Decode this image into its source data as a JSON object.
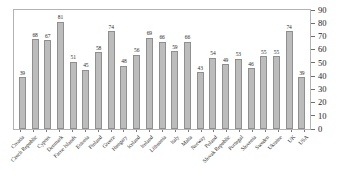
{
  "chart_data": {
    "type": "bar",
    "title": "",
    "subtitle": "",
    "xlabel": "",
    "ylabel": "",
    "ylim": [
      0,
      90
    ],
    "yticks": [
      0,
      10,
      20,
      30,
      40,
      50,
      60,
      70,
      80,
      90
    ],
    "y_axis_position": "right",
    "grid": false,
    "legend": "none",
    "bar_fill_color": "#bcbcbc",
    "bar_border_color": "#8f8f8f",
    "frame_color": "#b3b3b3",
    "categories": [
      "Croatia",
      "Czech Republic",
      "Cyprus",
      "Denmark",
      "Faroe Islands",
      "Estonia",
      "Finland",
      "Greece",
      "Hungary",
      "Iceland",
      "Ireland",
      "Lithuania",
      "Italy",
      "Malta",
      "Norway",
      "Poland",
      "Slovak Republic",
      "Portugal",
      "Slovenia",
      "Sweden",
      "Ukraine",
      "UK",
      "USA"
    ],
    "values": [
      39,
      68,
      67,
      81,
      51,
      45,
      58,
      74,
      48,
      56,
      69,
      66,
      59,
      66,
      43,
      54,
      49,
      53,
      46,
      55,
      55,
      74,
      39
    ],
    "data_labels": [
      "39",
      "68",
      "67",
      "81",
      "51",
      "45",
      "58",
      "74",
      "48",
      "56",
      "69",
      "66",
      "59",
      "66",
      "43",
      "54",
      "49",
      "53",
      "46",
      "55",
      "55",
      "74",
      "39"
    ]
  }
}
